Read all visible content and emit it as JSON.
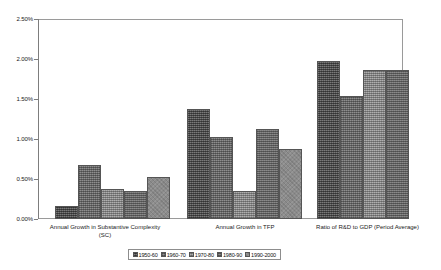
{
  "chart_data": {
    "type": "bar",
    "title": "",
    "xlabel": "",
    "ylabel": "",
    "ylim": [
      0,
      0.025
    ],
    "grid": false,
    "legend_position": "bottom",
    "y_ticks": [
      "0.00%",
      "0.50%",
      "1.00%",
      "1.50%",
      "2.00%",
      "2.50%"
    ],
    "y_tick_values": [
      0.0,
      0.005,
      0.01,
      0.015,
      0.02,
      0.025
    ],
    "categories": [
      "Annual Growth in Substantive Complexity\n(SC)",
      "Annual Growth in TFP",
      "Ratio of R&D to GDP (Period Average)"
    ],
    "series": [
      {
        "name": "1950-60",
        "values": [
          0.0016,
          0.0138,
          0.0198
        ]
      },
      {
        "name": "1960-70",
        "values": [
          0.0068,
          0.0103,
          0.0154
        ]
      },
      {
        "name": "1970-80",
        "values": [
          0.0037,
          0.0035,
          0.0186
        ]
      },
      {
        "name": "1980-90",
        "values": [
          0.0035,
          0.0113,
          0.0186
        ]
      },
      {
        "name": "1990-2000",
        "values": [
          0.0052,
          0.0088,
          null
        ]
      }
    ],
    "value_labels": [
      [
        "0.16%",
        "1.38%",
        "1.98%"
      ],
      [
        "0.68%",
        "1.03%",
        "1.54%"
      ],
      [
        "0.37%",
        "0.35%",
        "1.86%"
      ],
      [
        "0.35%",
        "1.13%",
        "1.86%"
      ],
      [
        "0.52%",
        "0.88%",
        ""
      ]
    ],
    "colors": {
      "series": [
        "#5d5d5d",
        "#8e8e8e",
        "#949494",
        "#8a8a8a",
        "#8b8b8b"
      ],
      "axis": "#7d7d7d",
      "frame": "#9a9a9a",
      "text": "#1a1a1a",
      "background": "#ffffff"
    }
  },
  "axis": {
    "labels": [
      "2.50%",
      "2.00%",
      "1.50%",
      "1.00%",
      "0.50%",
      "0.00%"
    ]
  },
  "categories": {
    "c0": "Annual Growth in Substantive Complexity\n(SC)",
    "c1": "Annual Growth in TFP",
    "c2": "Ratio of R&D to GDP (Period Average)"
  },
  "legend": {
    "items": [
      {
        "label": "1950-60"
      },
      {
        "label": "1960-70"
      },
      {
        "label": "1970-80"
      },
      {
        "label": "1980-90"
      },
      {
        "label": "1990-2000"
      }
    ]
  }
}
